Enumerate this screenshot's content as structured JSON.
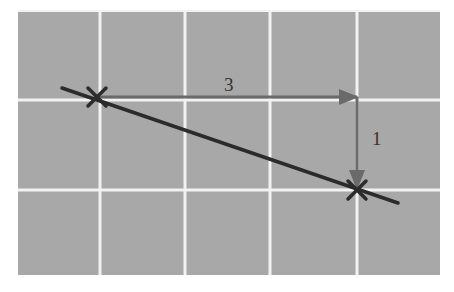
{
  "diagram": {
    "type": "slope-triangle-on-grid",
    "colors": {
      "background": "#a8a8a8",
      "grid_line": "#f2f2f2",
      "line": "#2b2b2b",
      "arrow": "#6a6a6a",
      "marker": "#2b2b2b",
      "label": "#333333"
    },
    "grid": {
      "x": 18,
      "y": 10,
      "width": 422,
      "height": 265,
      "vertical_lines": [
        100,
        185,
        270,
        357
      ],
      "horizontal_lines": [
        100,
        190
      ]
    },
    "line": {
      "x1": 62,
      "y1": 88,
      "x2": 398,
      "y2": 203
    },
    "points": [
      {
        "name": "start-point",
        "x": 97,
        "y": 97
      },
      {
        "name": "end-point",
        "x": 357,
        "y": 190
      }
    ],
    "run": {
      "label": "3",
      "x1": 97,
      "y1": 97,
      "x2": 357,
      "y2": 97,
      "label_x": 224,
      "label_y": 91
    },
    "rise": {
      "label": "1",
      "x1": 357,
      "y1": 97,
      "x2": 357,
      "y2": 188,
      "label_x": 372,
      "label_y": 145
    }
  }
}
